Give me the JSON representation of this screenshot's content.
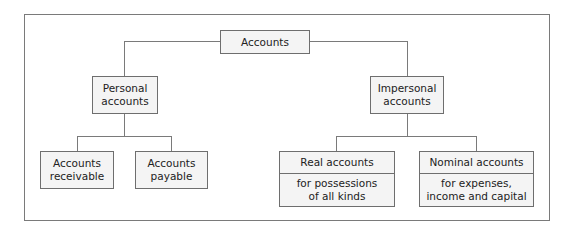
{
  "diagram": {
    "root": {
      "label": "Accounts"
    },
    "personal": {
      "line1": "Personal",
      "line2": "accounts",
      "children": [
        {
          "line1": "Accounts",
          "line2": "receivable"
        },
        {
          "line1": "Accounts",
          "line2": "payable"
        }
      ]
    },
    "impersonal": {
      "line1": "Impersonal",
      "line2": "accounts",
      "children": [
        {
          "title": "Real accounts",
          "line1": "for possessions",
          "line2": "of all kinds"
        },
        {
          "title": "Nominal accounts",
          "line1": "for expenses,",
          "line2": "income and capital"
        }
      ]
    }
  }
}
